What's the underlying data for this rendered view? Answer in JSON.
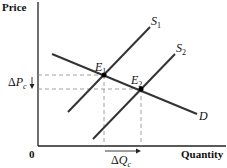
{
  "diagram": {
    "type": "supply-demand",
    "axes": {
      "y_label": "Price",
      "x_label": "Quantity",
      "origin_label": "0"
    },
    "curves": [
      {
        "name": "S",
        "sub": "1",
        "kind": "supply"
      },
      {
        "name": "S",
        "sub": "2",
        "kind": "supply"
      },
      {
        "name": "D",
        "sub": "",
        "kind": "demand"
      }
    ],
    "equilibria": [
      {
        "name": "E",
        "sub": "1"
      },
      {
        "name": "E",
        "sub": "2"
      }
    ],
    "annotations": {
      "delta_p": {
        "delta": "Δ",
        "var": "P",
        "sub": "c"
      },
      "delta_q": {
        "delta": "Δ",
        "var": "Q",
        "sub": "c"
      }
    },
    "colors": {
      "line": "#222222",
      "dash": "#777777"
    }
  }
}
